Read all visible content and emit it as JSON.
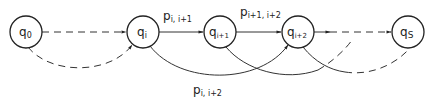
{
  "diagram": {
    "type": "state-transition",
    "nodes": [
      {
        "id": "q0",
        "base": "q",
        "sub": "0",
        "cx": 26,
        "cy": 32
      },
      {
        "id": "qi",
        "base": "q",
        "sub": "i",
        "cx": 143,
        "cy": 32
      },
      {
        "id": "qi1",
        "base": "q",
        "sub": "i+1",
        "cx": 220,
        "cy": 32
      },
      {
        "id": "qi2",
        "base": "q",
        "sub": "i+2",
        "cx": 298,
        "cy": 32
      },
      {
        "id": "qs",
        "base": "q",
        "sub": "S",
        "cx": 408,
        "cy": 32
      }
    ],
    "labels": {
      "p_i_i1": {
        "base": "p",
        "sub": "i, i+1"
      },
      "p_i1_i2": {
        "base": "p",
        "sub": "i+1, i+2"
      },
      "p_i_i2": {
        "base": "p",
        "sub": "i, i+2"
      }
    },
    "edges": [
      {
        "from": "q0",
        "to": "qi",
        "style": "dashed",
        "shape": "straight"
      },
      {
        "from": "q0",
        "to": "qi",
        "style": "dashed",
        "shape": "curve-below"
      },
      {
        "from": "qi",
        "to": "qi1",
        "style": "solid",
        "shape": "straight",
        "label": "p_i_i1"
      },
      {
        "from": "qi1",
        "to": "qi2",
        "style": "solid",
        "shape": "straight",
        "label": "p_i1_i2"
      },
      {
        "from": "qi2",
        "to": "qs",
        "style": "dashed",
        "shape": "straight"
      },
      {
        "from": "qi",
        "to": "qi2",
        "style": "solid",
        "shape": "curve-below",
        "label": "p_i_i2"
      },
      {
        "from": "qi1",
        "to": "beyond",
        "style": "solid-then-dashed",
        "shape": "curve-below"
      },
      {
        "from": "qi2",
        "to": "qs",
        "style": "solid-then-dashed",
        "shape": "curve-below"
      }
    ]
  }
}
